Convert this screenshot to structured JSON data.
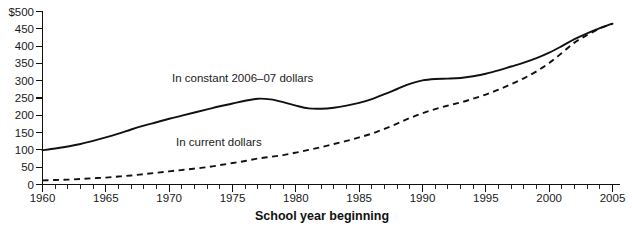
{
  "chart_data": {
    "type": "line",
    "title": "",
    "xlabel": "School year beginning",
    "ylabel": "",
    "xlim": [
      1960,
      2005
    ],
    "ylim": [
      0,
      500
    ],
    "grid": false,
    "legend_position": "inline-annotations",
    "x_tick_labels": [
      "1960",
      "1965",
      "1970",
      "1975",
      "1980",
      "1985",
      "1990",
      "1995",
      "2000",
      "2005"
    ],
    "x_tick_values": [
      1960,
      1965,
      1970,
      1975,
      1980,
      1985,
      1990,
      1995,
      2000,
      2005
    ],
    "x_minor_tick_step": 1,
    "y_tick_labels": [
      "$500",
      "450",
      "400",
      "350",
      "300",
      "250",
      "200",
      "150",
      "100",
      "50",
      "0"
    ],
    "y_tick_values": [
      500,
      450,
      400,
      350,
      300,
      250,
      200,
      150,
      100,
      50,
      0
    ],
    "x": [
      1960,
      1961,
      1962,
      1963,
      1964,
      1965,
      1966,
      1967,
      1968,
      1969,
      1970,
      1971,
      1972,
      1973,
      1974,
      1975,
      1976,
      1977,
      1978,
      1979,
      1980,
      1981,
      1982,
      1983,
      1984,
      1985,
      1986,
      1987,
      1988,
      1989,
      1990,
      1991,
      1992,
      1993,
      1994,
      1995,
      1996,
      1997,
      1998,
      1999,
      2000,
      2001,
      2002,
      2003,
      2004,
      2005
    ],
    "series": [
      {
        "name": "In constant 2006–07 dollars",
        "style": "solid",
        "annotation": "In constant 2006–07 dollars",
        "values": [
          99,
          104,
          110,
          117,
          126,
          136,
          147,
          159,
          170,
          180,
          190,
          199,
          208,
          217,
          226,
          234,
          242,
          248,
          246,
          238,
          228,
          220,
          219,
          222,
          228,
          236,
          247,
          261,
          276,
          291,
          301,
          305,
          306,
          308,
          313,
          320,
          330,
          341,
          352,
          365,
          381,
          400,
          420,
          437,
          452,
          465
        ]
      },
      {
        "name": "In current dollars",
        "style": "dashed",
        "annotation": "In current dollars",
        "values": [
          12,
          13,
          14,
          16,
          18,
          20,
          23,
          26,
          30,
          34,
          38,
          42,
          46,
          50,
          56,
          62,
          68,
          75,
          80,
          85,
          92,
          100,
          108,
          117,
          126,
          136,
          147,
          161,
          176,
          192,
          206,
          218,
          228,
          237,
          248,
          260,
          274,
          290,
          307,
          327,
          351,
          380,
          410,
          432,
          451,
          464
        ]
      }
    ]
  },
  "annotations": {
    "constant_label": "In constant 2006–07 dollars",
    "current_label": "In current dollars",
    "x_axis_title": "School year beginning"
  },
  "colors": {
    "line": "#111111",
    "text": "#1a1a1a",
    "background": "#ffffff"
  },
  "clipped_top_caption": ""
}
